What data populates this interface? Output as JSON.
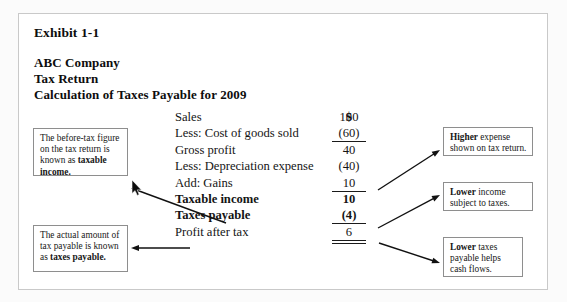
{
  "exhibit": {
    "number": "Exhibit 1-1",
    "company": "ABC Company",
    "doc_type": "Tax Return",
    "subtitle": "Calculation of Taxes Payable for 2009",
    "currency_header": "$"
  },
  "statement": {
    "rows": [
      {
        "label": "Sales",
        "value": "100",
        "bold": false,
        "rule": "none"
      },
      {
        "label": "Less: Cost of goods sold",
        "value": "(60)",
        "bold": false,
        "rule": "single"
      },
      {
        "label": "Gross profit",
        "value": "40",
        "bold": false,
        "rule": "none"
      },
      {
        "label": "Less: Depreciation expense",
        "value": "(40)",
        "bold": false,
        "rule": "none"
      },
      {
        "label": "Add: Gains",
        "value": "10",
        "bold": false,
        "rule": "single"
      },
      {
        "label": "Taxable income",
        "value": "10",
        "bold": true,
        "rule": "none"
      },
      {
        "label": "Taxes payable",
        "value": "(4)",
        "bold": true,
        "rule": "single"
      },
      {
        "label": "Profit after tax",
        "value": "6",
        "bold": false,
        "rule": "double"
      }
    ]
  },
  "callouts": {
    "taxable_income": {
      "text_before": "The before-tax figure on the tax return is known as ",
      "text_bold": "taxable income."
    },
    "tax_payable": {
      "text_before": "The actual amount of tax payable is known as ",
      "text_bold": "taxes payable."
    },
    "higher_expense": {
      "text_bold": "Higher",
      "text_after": " expense shown on tax return."
    },
    "lower_income": {
      "text_bold": "Lower",
      "text_after": " income subject to taxes."
    },
    "lower_taxes": {
      "text_bold": "Lower",
      "text_after": " taxes payable helps cash flows."
    }
  },
  "colors": {
    "page_background": "#fbfbfb",
    "exhibit_background": "#ffffff",
    "frame_border": "#c9c9c9",
    "callout_border": "#8e8e8e",
    "text": "#141414",
    "arrow": "#111111"
  },
  "arrows": [
    {
      "name": "arrow-to-taxable-income-callout",
      "from": [
        226,
        223
      ],
      "to": [
        131,
        188
      ]
    },
    {
      "name": "arrow-to-tax-payable-callout",
      "from": [
        190,
        248
      ],
      "to": [
        131,
        248
      ]
    },
    {
      "name": "arrow-to-higher-expense-callout",
      "from": [
        378,
        190
      ],
      "to": [
        440,
        150
      ]
    },
    {
      "name": "arrow-to-lower-income-callout",
      "from": [
        378,
        228
      ],
      "to": [
        440,
        195
      ]
    },
    {
      "name": "arrow-to-lower-taxes-callout",
      "from": [
        379,
        243
      ],
      "to": [
        440,
        263
      ]
    }
  ],
  "cursor": {
    "name": "mouse-pointer",
    "x": 131,
    "y": 180
  }
}
